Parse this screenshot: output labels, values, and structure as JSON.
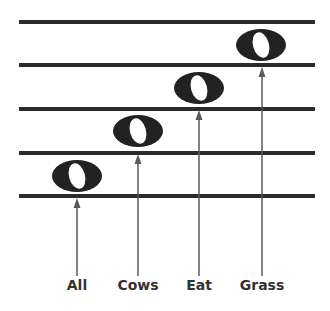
{
  "diagram": {
    "colors": {
      "staff": "#2b2b2b",
      "note": "#222222",
      "arrow": "#5a5a5a",
      "label": "#333333"
    },
    "staff_lines_y": [
      22,
      65,
      109,
      153,
      196
    ],
    "notes": [
      {
        "label": "All",
        "x": 77,
        "y": 176
      },
      {
        "label": "Cows",
        "x": 138,
        "y": 131
      },
      {
        "label": "Eat",
        "x": 199,
        "y": 88
      },
      {
        "label": "Grass",
        "x": 261,
        "y": 45
      }
    ]
  }
}
